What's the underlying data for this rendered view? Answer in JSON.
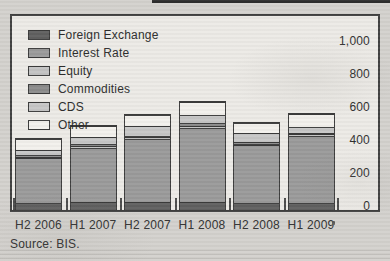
{
  "page": {
    "source_label": "Source: BIS.",
    "background_color": "#d3d1cd",
    "chart_background_color": "#eceae6",
    "border_color": "#3e3e3e"
  },
  "chart_data": {
    "type": "bar",
    "stacked": true,
    "title": "",
    "xlabel": "",
    "ylabel": "",
    "categories": [
      "H2 2006",
      "H1 2007",
      "H2 2007",
      "H1 2008",
      "H2 2008",
      "H1 2009"
    ],
    "series": [
      {
        "name": "Foreign Exchange",
        "color": "#5e5e5e",
        "values": [
          44,
          46,
          48,
          48,
          45,
          45
        ]
      },
      {
        "name": "Interest Rate",
        "color": "#999999",
        "values": [
          270,
          332,
          383,
          450,
          348,
          403
        ]
      },
      {
        "name": "Equity",
        "color": "#c2c2c2",
        "values": [
          8,
          10,
          10,
          14,
          10,
          10
        ]
      },
      {
        "name": "Commodities",
        "color": "#8a8a8a",
        "values": [
          8,
          11,
          10,
          14,
          10,
          10
        ]
      },
      {
        "name": "CDS",
        "color": "#c6c6c6",
        "values": [
          32,
          44,
          60,
          53,
          53,
          35
        ]
      },
      {
        "name": "Other",
        "color": "#f2f0ec",
        "values": [
          66,
          64,
          68,
          77,
          61,
          77
        ]
      }
    ],
    "totals": [
      428,
      507,
      579,
      656,
      527,
      580
    ],
    "y_ticks": [
      "0",
      "200",
      "400",
      "600",
      "800",
      "1,000"
    ],
    "ylim": [
      0,
      1000
    ],
    "grid": false,
    "legend_position": "top-left-inside"
  }
}
